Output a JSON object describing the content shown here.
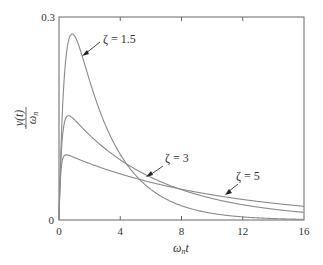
{
  "chart_data": {
    "type": "line",
    "title": "",
    "xlabel": "ωnt",
    "ylabel": "y(t)/ωn",
    "xlim": [
      0,
      16
    ],
    "ylim": [
      0,
      0.3
    ],
    "grid": false,
    "legend": "none (inline annotations)",
    "x_ticks": [
      0,
      4,
      8,
      12,
      16
    ],
    "y_ticks": [
      0,
      0.3
    ],
    "x_tick_labels": [
      "0",
      "4",
      "8",
      "12",
      "16"
    ],
    "y_tick_labels": [
      "0",
      "0.3"
    ],
    "x": [
      0,
      0.5,
      1,
      1.5,
      2,
      3,
      4,
      5,
      6,
      8,
      10,
      12,
      14,
      16
    ],
    "series": [
      {
        "name": "ζ = 1.5",
        "zeta": 1.5,
        "values": [
          0,
          0.24,
          0.275,
          0.258,
          0.228,
          0.166,
          0.117,
          0.081,
          0.057,
          0.027,
          0.013,
          0.006,
          0.003,
          0.001
        ]
      },
      {
        "name": "ζ = 3",
        "zeta": 3,
        "values": [
          0,
          0.147,
          0.155,
          0.145,
          0.134,
          0.114,
          0.097,
          0.082,
          0.07,
          0.05,
          0.036,
          0.026,
          0.019,
          0.014
        ]
      },
      {
        "name": "ζ = 5",
        "zeta": 5,
        "values": [
          0,
          0.093,
          0.091,
          0.087,
          0.083,
          0.075,
          0.068,
          0.062,
          0.056,
          0.046,
          0.038,
          0.031,
          0.025,
          0.021
        ]
      }
    ],
    "annotations": [
      {
        "text": "ζ = 1.5",
        "x": 2.8,
        "y": 0.26,
        "arrow_to": [
          1.5,
          0.258
        ]
      },
      {
        "text": "ζ = 3",
        "x": 8.3,
        "y": 0.134,
        "arrow_to": [
          5.9,
          0.095
        ]
      },
      {
        "text": "ζ = 5",
        "x": 11.8,
        "y": 0.087,
        "arrow_to": [
          9.4,
          0.053
        ]
      }
    ]
  },
  "axes": {
    "y_label_num": "y(t)",
    "y_label_den": "ωn",
    "x_label": "ωnt",
    "y_top": "0.3",
    "y_zero": "0",
    "x_ticks": [
      "0",
      "4",
      "8",
      "12",
      "16"
    ]
  },
  "labels": {
    "z15": "ζ = 1.5",
    "z3": "ζ = 3",
    "z5": "ζ = 5"
  },
  "colors": {
    "curve": "#8a8a8a",
    "axis": "#555555",
    "text": "#333333"
  }
}
